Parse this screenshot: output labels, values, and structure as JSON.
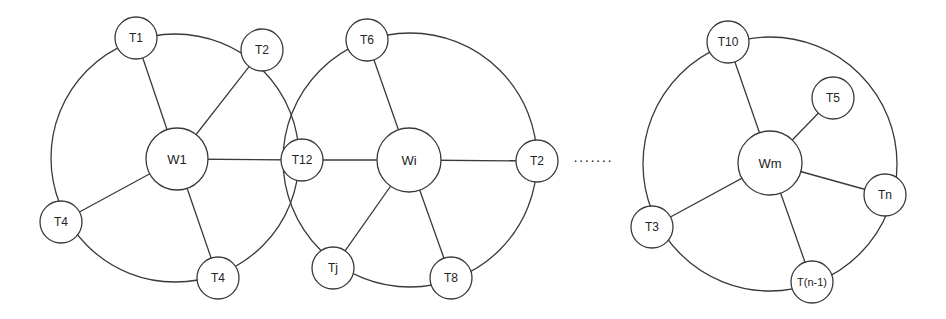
{
  "diagram": {
    "type": "network-clusters",
    "clusters": [
      {
        "hub": "W1",
        "terminals": [
          "T1",
          "T2",
          "T12",
          "T4",
          "T4"
        ]
      },
      {
        "hub": "Wi",
        "terminals": [
          "T6",
          "T2",
          "T8",
          "Tj",
          "T12"
        ]
      },
      {
        "hub": "Wm",
        "terminals": [
          "T10",
          "T5",
          "Tn",
          "T(n-1)",
          "T3"
        ]
      }
    ],
    "ellipsis": "·······",
    "colors": {
      "stroke": "#3a3a3a",
      "background": "#ffffff",
      "text": "#222222"
    }
  }
}
